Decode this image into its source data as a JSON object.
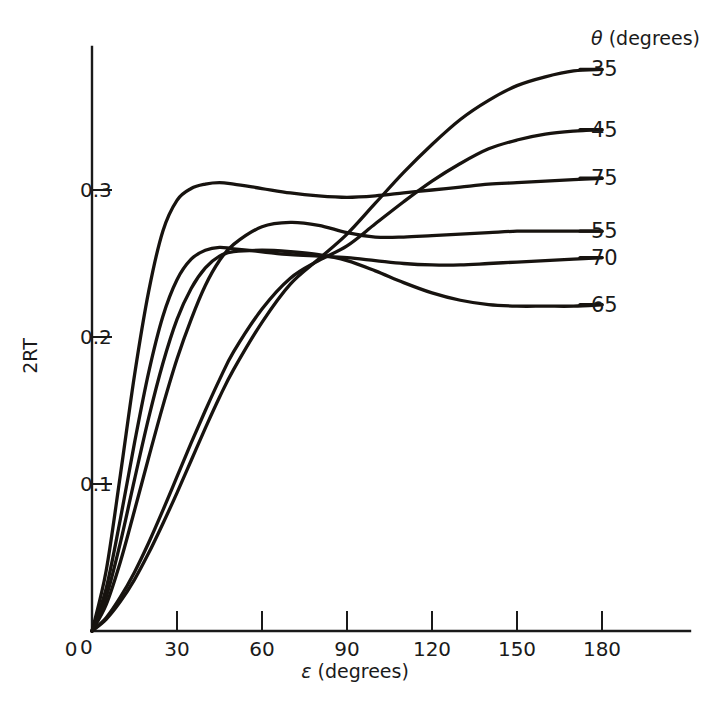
{
  "chart_data": {
    "type": "line",
    "title": "",
    "subtitle": "",
    "xlabel": "ε (degrees)",
    "ylabel": "2RT",
    "legend_title": "θ (degrees)",
    "legend_position": "right-of-plot, at curve ends",
    "grid": false,
    "xlim": [
      0,
      195
    ],
    "ylim": [
      0,
      0.405
    ],
    "xticks": [
      0,
      30,
      60,
      90,
      120,
      150,
      180
    ],
    "xticklabels": [
      "0",
      "30",
      "60",
      "90",
      "120",
      "150",
      "180"
    ],
    "yticks": [
      0,
      0.1,
      0.2,
      0.3
    ],
    "yticklabels": [
      "0",
      "0.1",
      "0.2",
      "0.3"
    ],
    "x": [
      0,
      5,
      10,
      15,
      20,
      25,
      30,
      35,
      40,
      45,
      50,
      60,
      70,
      80,
      90,
      100,
      110,
      120,
      130,
      140,
      150,
      160,
      170,
      180
    ],
    "series": [
      {
        "name": "35",
        "label": "35",
        "values": [
          0.0,
          0.008,
          0.02,
          0.035,
          0.053,
          0.073,
          0.094,
          0.116,
          0.138,
          0.159,
          0.178,
          0.21,
          0.236,
          0.253,
          0.27,
          0.291,
          0.312,
          0.331,
          0.348,
          0.361,
          0.371,
          0.377,
          0.381,
          0.382
        ]
      },
      {
        "name": "45",
        "label": "45",
        "values": [
          0.0,
          0.009,
          0.023,
          0.04,
          0.06,
          0.082,
          0.105,
          0.128,
          0.15,
          0.171,
          0.19,
          0.219,
          0.24,
          0.252,
          0.262,
          0.277,
          0.292,
          0.306,
          0.318,
          0.328,
          0.334,
          0.338,
          0.34,
          0.341
        ]
      },
      {
        "name": "75",
        "label": "75",
        "values": [
          0.0,
          0.041,
          0.106,
          0.174,
          0.231,
          0.272,
          0.293,
          0.301,
          0.304,
          0.305,
          0.304,
          0.301,
          0.298,
          0.296,
          0.295,
          0.296,
          0.298,
          0.3,
          0.302,
          0.304,
          0.305,
          0.306,
          0.307,
          0.308
        ]
      },
      {
        "name": "55",
        "label": "55",
        "values": [
          0.0,
          0.018,
          0.047,
          0.082,
          0.118,
          0.153,
          0.185,
          0.212,
          0.235,
          0.252,
          0.263,
          0.275,
          0.278,
          0.276,
          0.271,
          0.268,
          0.268,
          0.269,
          0.27,
          0.271,
          0.272,
          0.272,
          0.272,
          0.272
        ]
      },
      {
        "name": "70",
        "label": "70",
        "values": [
          0.0,
          0.029,
          0.076,
          0.128,
          0.176,
          0.214,
          0.239,
          0.253,
          0.259,
          0.261,
          0.26,
          0.258,
          0.256,
          0.255,
          0.254,
          0.252,
          0.25,
          0.249,
          0.249,
          0.25,
          0.251,
          0.252,
          0.253,
          0.254
        ]
      },
      {
        "name": "65",
        "label": "65",
        "values": [
          0.0,
          0.023,
          0.06,
          0.103,
          0.145,
          0.182,
          0.212,
          0.233,
          0.247,
          0.255,
          0.258,
          0.259,
          0.258,
          0.256,
          0.252,
          0.245,
          0.237,
          0.23,
          0.225,
          0.222,
          0.221,
          0.221,
          0.221,
          0.222
        ]
      }
    ],
    "legend_entries": [
      {
        "label": "35",
        "end_value": 0.382
      },
      {
        "label": "45",
        "end_value": 0.341
      },
      {
        "label": "75",
        "end_value": 0.308
      },
      {
        "label": "55",
        "end_value": 0.272
      },
      {
        "label": "70",
        "end_value": 0.254
      },
      {
        "label": "65",
        "end_value": 0.222
      }
    ]
  },
  "figure": {
    "background_color": "#ffffff",
    "line_color": "#17130f",
    "axis_color": "#1a1a1a"
  }
}
